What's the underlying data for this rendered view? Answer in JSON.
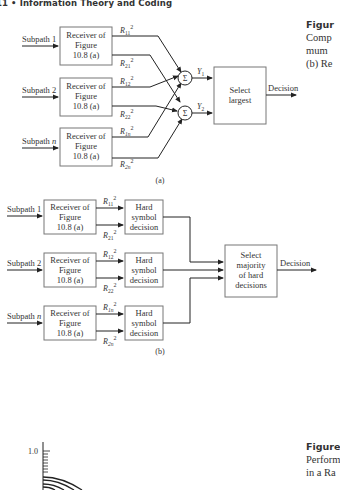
{
  "page": {
    "running_header": "11 • Information Theory and Coding"
  },
  "figure_top": {
    "caption_title": "Figur",
    "caption_lines": [
      "Comp",
      "mum",
      "(b) Re"
    ],
    "part_a": {
      "label": "(a)",
      "subpaths": [
        "Subpath 1",
        "Subpath 2",
        "Subpath n"
      ],
      "receiver_lines": [
        "Receiver of",
        "Figure",
        "10.8 (a)"
      ],
      "outputs": [
        [
          "R11",
          "R21"
        ],
        [
          "R12",
          "R22"
        ],
        [
          "R1n",
          "R2n"
        ]
      ],
      "sum_symbol": "Σ",
      "sum_outputs": [
        "Y1",
        "Y2"
      ],
      "select_lines": [
        "Select",
        "largest"
      ],
      "decision": "Decision"
    },
    "part_b": {
      "label": "(b)",
      "subpaths": [
        "Subpath 1",
        "Subpath 2",
        "Subpath n"
      ],
      "receiver_lines": [
        "Receiver of",
        "Figure",
        "10.8 (a)"
      ],
      "outputs": [
        [
          "R11",
          "R21"
        ],
        [
          "R12",
          "R22"
        ],
        [
          "R1n",
          "R2n"
        ]
      ],
      "hard_lines": [
        "Hard",
        "symbol",
        "decision"
      ],
      "majority_lines": [
        "Select",
        "majority",
        "of hard",
        "decisions"
      ],
      "decision": "Decision"
    }
  },
  "figure_bottom": {
    "caption_title": "Figure",
    "caption_lines": [
      "Perform",
      "in a Ra"
    ],
    "y_tick_label": "1.0"
  }
}
